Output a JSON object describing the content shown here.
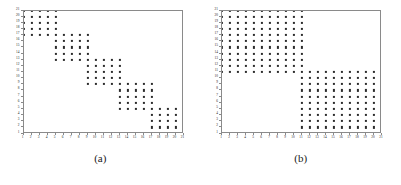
{
  "figure": {
    "background": "#ffffff",
    "dot_color": "#2b2b2b",
    "axis_color": "#8a8a8a",
    "panels": [
      {
        "caption": "(a)",
        "name": "panel-a",
        "chart_ref": 0
      },
      {
        "caption": "(b)",
        "name": "panel-b",
        "chart_ref": 1
      }
    ]
  },
  "chart_data": [
    {
      "type": "scatter",
      "title": "(a)",
      "xlabel": "",
      "ylabel": "",
      "xlim": [
        1,
        21
      ],
      "ylim": [
        1,
        21
      ],
      "grid": false,
      "legend": null,
      "xticks": [
        1,
        2,
        3,
        4,
        5,
        6,
        7,
        8,
        9,
        10,
        11,
        12,
        13,
        14,
        15,
        16,
        17,
        18,
        19,
        20,
        21
      ],
      "yticks": [
        1,
        2,
        3,
        4,
        5,
        6,
        7,
        8,
        9,
        10,
        11,
        12,
        13,
        14,
        15,
        16,
        17,
        18,
        19,
        20,
        21
      ],
      "xticklabels": [
        "1",
        "2",
        "3",
        "4",
        "5",
        "6",
        "7",
        "8",
        "9",
        "10",
        "11",
        "12",
        "13",
        "14",
        "15",
        "16",
        "17",
        "18",
        "19",
        "20",
        "21"
      ],
      "yticklabels": [
        "1",
        "2",
        "3",
        "4",
        "5",
        "6",
        "7",
        "8",
        "9",
        "10",
        "11",
        "12",
        "13",
        "14",
        "15",
        "16",
        "17",
        "18",
        "19",
        "20",
        "21"
      ],
      "description": "Overlapping block-diagonal staircase sparsity pattern",
      "blocks": [
        {
          "x0": 1,
          "x1": 5,
          "y0": 17,
          "y1": 21
        },
        {
          "x0": 5,
          "x1": 9,
          "y0": 13,
          "y1": 17
        },
        {
          "x0": 9,
          "x1": 13,
          "y0": 9,
          "y1": 13
        },
        {
          "x0": 13,
          "x1": 17,
          "y0": 5,
          "y1": 9
        },
        {
          "x0": 17,
          "x1": 21,
          "y0": 1,
          "y1": 5
        }
      ]
    },
    {
      "type": "scatter",
      "title": "(b)",
      "xlabel": "",
      "ylabel": "",
      "xlim": [
        1,
        21
      ],
      "ylim": [
        1,
        21
      ],
      "grid": false,
      "legend": null,
      "xticks": [
        1,
        2,
        3,
        4,
        5,
        6,
        7,
        8,
        9,
        10,
        11,
        12,
        13,
        14,
        15,
        16,
        17,
        18,
        19,
        20,
        21
      ],
      "yticks": [
        1,
        2,
        3,
        4,
        5,
        6,
        7,
        8,
        9,
        10,
        11,
        12,
        13,
        14,
        15,
        16,
        17,
        18,
        19,
        20,
        21
      ],
      "xticklabels": [
        "1",
        "2",
        "3",
        "4",
        "5",
        "6",
        "7",
        "8",
        "9",
        "10",
        "11",
        "12",
        "13",
        "14",
        "15",
        "16",
        "17",
        "18",
        "19",
        "20",
        "21"
      ],
      "yticklabels": [
        "1",
        "2",
        "3",
        "4",
        "5",
        "6",
        "7",
        "8",
        "9",
        "10",
        "11",
        "12",
        "13",
        "14",
        "15",
        "16",
        "17",
        "18",
        "19",
        "20",
        "21"
      ],
      "description": "Two large overlapping diagonal blocks sparsity pattern",
      "blocks": [
        {
          "x0": 1,
          "x1": 11,
          "y0": 11,
          "y1": 21
        },
        {
          "x0": 11,
          "x1": 21,
          "y0": 1,
          "y1": 11
        }
      ]
    }
  ]
}
